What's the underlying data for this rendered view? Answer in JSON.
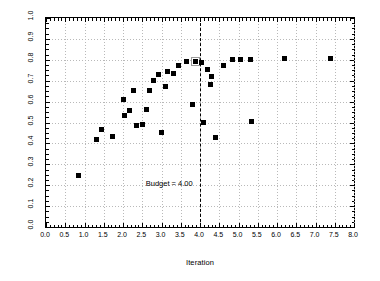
{
  "chart_data": {
    "type": "scatter",
    "title": "",
    "xlabel": "Iteration",
    "ylabel": "Possible Alternatives in C–E Space",
    "xlim": [
      0.0,
      8.0
    ],
    "ylim": [
      0.0,
      1.0
    ],
    "xticks": [
      "0.0",
      "0.5",
      "1.0",
      "1.5",
      "2.0",
      "2.5",
      "3.0",
      "3.5",
      "4.0",
      "4.5",
      "5.0",
      "5.5",
      "6.0",
      "6.5",
      "7.0",
      "7.5",
      "8.0"
    ],
    "yticks": [
      "0.0",
      "0.1",
      "0.2",
      "0.3",
      "0.4",
      "0.5",
      "0.6",
      "0.7",
      "0.8",
      "0.9",
      "1.0"
    ],
    "xtick_values": [
      0.0,
      0.5,
      1.0,
      1.5,
      2.0,
      2.5,
      3.0,
      3.5,
      4.0,
      4.5,
      5.0,
      5.5,
      6.0,
      6.5,
      7.0,
      7.5,
      8.0
    ],
    "ytick_values": [
      0.0,
      0.1,
      0.2,
      0.3,
      0.4,
      0.5,
      0.6,
      0.7,
      0.8,
      0.9,
      1.0
    ],
    "grid": true,
    "legend": null,
    "marker": "square",
    "marker_color": "#000000",
    "points": [
      {
        "x": 0.85,
        "y": 0.245,
        "selected": false
      },
      {
        "x": 1.45,
        "y": 0.465,
        "selected": false
      },
      {
        "x": 1.3,
        "y": 0.42,
        "selected": false
      },
      {
        "x": 1.72,
        "y": 0.435,
        "selected": false
      },
      {
        "x": 2.02,
        "y": 0.612,
        "selected": false
      },
      {
        "x": 2.05,
        "y": 0.535,
        "selected": false
      },
      {
        "x": 2.18,
        "y": 0.558,
        "selected": false
      },
      {
        "x": 2.35,
        "y": 0.485,
        "selected": false
      },
      {
        "x": 2.5,
        "y": 0.49,
        "selected": false
      },
      {
        "x": 2.27,
        "y": 0.655,
        "selected": false
      },
      {
        "x": 2.6,
        "y": 0.56,
        "selected": false
      },
      {
        "x": 2.7,
        "y": 0.655,
        "selected": false
      },
      {
        "x": 2.78,
        "y": 0.7,
        "selected": false
      },
      {
        "x": 2.92,
        "y": 0.73,
        "selected": false
      },
      {
        "x": 3.0,
        "y": 0.45,
        "selected": false
      },
      {
        "x": 3.1,
        "y": 0.67,
        "selected": false
      },
      {
        "x": 3.15,
        "y": 0.745,
        "selected": false
      },
      {
        "x": 3.3,
        "y": 0.735,
        "selected": false
      },
      {
        "x": 3.45,
        "y": 0.772,
        "selected": false
      },
      {
        "x": 3.65,
        "y": 0.79,
        "selected": false
      },
      {
        "x": 3.88,
        "y": 0.79,
        "selected": true
      },
      {
        "x": 3.8,
        "y": 0.585,
        "selected": false
      },
      {
        "x": 4.05,
        "y": 0.785,
        "selected": false
      },
      {
        "x": 4.2,
        "y": 0.755,
        "selected": false
      },
      {
        "x": 4.3,
        "y": 0.72,
        "selected": false
      },
      {
        "x": 4.28,
        "y": 0.68,
        "selected": false
      },
      {
        "x": 4.08,
        "y": 0.5,
        "selected": false
      },
      {
        "x": 4.4,
        "y": 0.43,
        "selected": false
      },
      {
        "x": 4.6,
        "y": 0.775,
        "selected": false
      },
      {
        "x": 4.85,
        "y": 0.8,
        "selected": false
      },
      {
        "x": 5.05,
        "y": 0.8,
        "selected": false
      },
      {
        "x": 5.3,
        "y": 0.8,
        "selected": false
      },
      {
        "x": 5.35,
        "y": 0.505,
        "selected": false
      },
      {
        "x": 6.2,
        "y": 0.805,
        "selected": false
      },
      {
        "x": 7.4,
        "y": 0.805,
        "selected": false
      }
    ],
    "annotations": [
      {
        "name": "budget-line",
        "type": "vline",
        "x": 4.0,
        "style": "dashed",
        "label": "Budget = 4.00",
        "label_x": 3.2,
        "label_y": 0.205
      }
    ]
  }
}
